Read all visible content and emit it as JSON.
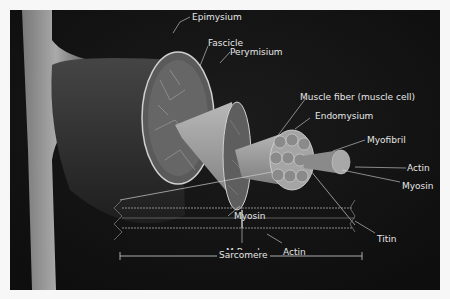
{
  "diagram": {
    "labels": {
      "epimysium": "Epimysium",
      "fascicle": "Fascicle",
      "perymisium": "Perymisium",
      "muscle_fiber": "Muscle fiber (muscle cell)",
      "endomysium": "Endomysium",
      "myofibril": "Myofibril",
      "actin_top": "Actin",
      "myosin_top": "Myosin",
      "myosin_bottom": "Myosin",
      "m_band": "M-Band",
      "actin_bottom": "Actin",
      "titin": "Titin",
      "sarcomere": "Sarcomere"
    },
    "colors": {
      "background": "#141414",
      "frame": "#f7f7f7",
      "label_text": "#e6e6e6",
      "muscle_surface": "#3a3a3a",
      "cone": "#9a9a9a",
      "tendon": "#b5b5b5"
    }
  }
}
